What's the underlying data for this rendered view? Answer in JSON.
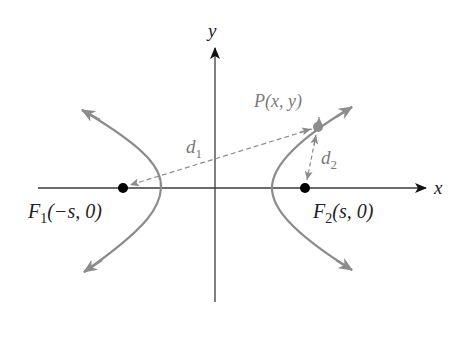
{
  "diagram": {
    "axes": {
      "x_label": "x",
      "y_label": "y"
    },
    "foci": [
      {
        "name": "F",
        "sub": "1",
        "coords": "(−s, 0)"
      },
      {
        "name": "F",
        "sub": "2",
        "coords": "(s, 0)"
      }
    ],
    "point": {
      "name": "P",
      "coords": "(x, y)"
    },
    "distances": [
      {
        "name": "d",
        "sub": "1"
      },
      {
        "name": "d",
        "sub": "2"
      }
    ],
    "colors": {
      "axis": "#3a3a3a",
      "curve": "#8c8c8c",
      "focus": "#000000",
      "point": "#8c8c8c",
      "dashed": "#8c8c8c",
      "label_gray": "#7a7a7a",
      "label_black": "#222222"
    }
  }
}
